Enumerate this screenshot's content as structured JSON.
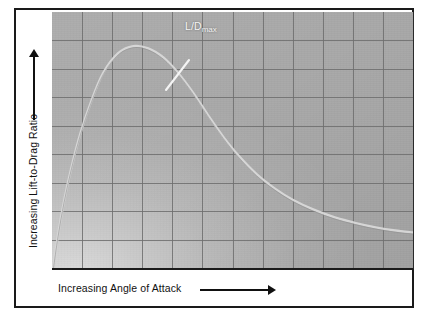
{
  "figure": {
    "background_color": "#ffffff",
    "frame_color": "#1a1a1a"
  },
  "axes": {
    "y": {
      "title": "Increasing Lift-to-Drag Ratio",
      "arrow_icon": "arrow-up-icon",
      "arrow_direction": "up"
    },
    "x": {
      "title": "Increasing Angle of Attack",
      "arrow_icon": "arrow-right-icon",
      "arrow_direction": "right"
    }
  },
  "annotations": [
    {
      "id": "ld-max",
      "label_main": "L/D",
      "label_sub": "max",
      "color": "#f4f4f4",
      "leader_from": [
        137,
        48
      ],
      "leader_to": [
        114,
        78
      ]
    }
  ],
  "chart_data": {
    "type": "line",
    "title": "",
    "subtitle": "",
    "xlabel": "Increasing Angle of Attack",
    "ylabel": "Increasing Lift-to-Drag Ratio",
    "xlim": [
      0,
      12
    ],
    "ylim": [
      0,
      9
    ],
    "x_tick_labels": [],
    "y_tick_labels": [],
    "grid": true,
    "grid_columns": 12,
    "grid_rows": 9,
    "grid_color": "#6e6e6e",
    "plot_background": "#a9a9a9",
    "legend": null,
    "legend_position": "none",
    "series": [
      {
        "name": "Lift-to-Drag Ratio vs Angle of Attack",
        "color": "#d8d8d8",
        "line_width": 2.4,
        "x": [
          0.05,
          0.2,
          0.4,
          0.65,
          0.95,
          1.3,
          1.7,
          2.2,
          2.7,
          3.2,
          3.7,
          4.2,
          4.7,
          5.2,
          5.7,
          6.2,
          6.8,
          7.4,
          8.0,
          8.7,
          9.4,
          10.1,
          10.8,
          11.4,
          12.0
        ],
        "y": [
          0.05,
          1.15,
          2.35,
          3.55,
          4.75,
          5.85,
          6.85,
          7.55,
          7.8,
          7.72,
          7.4,
          6.85,
          6.15,
          5.35,
          4.6,
          3.95,
          3.3,
          2.8,
          2.4,
          2.05,
          1.78,
          1.58,
          1.42,
          1.32,
          1.25
        ],
        "peak_point": [
          2.7,
          7.8
        ],
        "peak_label": "L/Dmax",
        "description": "Lift-to-drag ratio rises steeply with angle of attack, reaches a maximum (L/D max), then falls off and flattens at high angles of attack."
      }
    ]
  }
}
